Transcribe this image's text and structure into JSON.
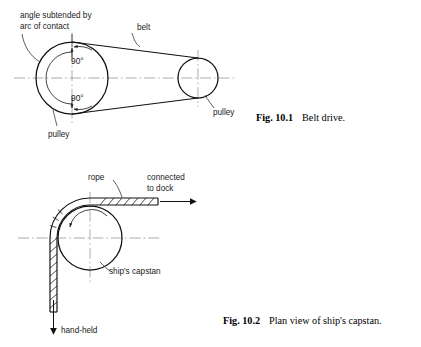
{
  "page": {
    "background": "#ffffff",
    "ink": "#111111",
    "centerline_color": "#8a8a8a"
  },
  "figures": [
    {
      "id": "belt-drive",
      "caption_number": "Fig. 10.1",
      "caption_text": "Belt drive.",
      "labels": {
        "angle_note_line1": "angle subtended by",
        "angle_note_line2": "arc of contact",
        "belt": "belt",
        "pulley_large": "pulley",
        "pulley_small": "pulley",
        "angle_upper": "90°",
        "angle_lower": "90°"
      },
      "geometry": {
        "large_pulley_center_x": 72,
        "large_pulley_center_y": 78,
        "large_pulley_radius": 36,
        "small_pulley_center_x": 198,
        "small_pulley_center_y": 78,
        "small_pulley_radius": 20,
        "contact_arc_radius": 26,
        "axis_y": 78
      }
    },
    {
      "id": "ships-capstan",
      "caption_number": "Fig. 10.2",
      "caption_text": "Plan view of ship's capstan.",
      "labels": {
        "rope": "rope",
        "connected_line1": "connected",
        "connected_line2": "to dock",
        "capstan": "ship's capstan",
        "hand_held": "hand-held"
      },
      "geometry": {
        "capstan_center_x": 90,
        "capstan_center_y": 238,
        "capstan_radius": 32,
        "rope_outer_radius": 40,
        "rope_band_width": 7,
        "axis_y": 238
      }
    }
  ]
}
